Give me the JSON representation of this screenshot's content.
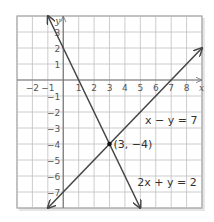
{
  "chart_data": {
    "type": "line",
    "title": "",
    "xlabel": "x",
    "ylabel": "y",
    "xlim": [
      -3,
      9
    ],
    "ylim": [
      -8,
      4
    ],
    "grid": true,
    "x_ticks": [
      "-2",
      "-1",
      "1",
      "2",
      "3",
      "4",
      "5",
      "6",
      "7",
      "8"
    ],
    "y_ticks": [
      "3",
      "2",
      "1",
      "-1",
      "-2",
      "-3",
      "-4",
      "-5",
      "-6",
      "-7"
    ],
    "series": [
      {
        "name": "x − y = 7",
        "equation": "x - y = 7",
        "points": [
          [
            -1,
            -8
          ],
          [
            9,
            2
          ]
        ],
        "color": "#444444"
      },
      {
        "name": "2x + y = 2",
        "equation": "2x + y = 2",
        "points": [
          [
            -1,
            4
          ],
          [
            5,
            -8
          ]
        ],
        "color": "#444444"
      }
    ],
    "annotations": [
      {
        "text": "(3, −4)",
        "x": 3,
        "y": -4,
        "marker": "point"
      },
      {
        "text": "x − y = 7",
        "near_series": 0
      },
      {
        "text": "2x + y = 2",
        "near_series": 1
      }
    ]
  },
  "labels": {
    "x_axis": "x",
    "y_axis": "y",
    "intersection": "(3, −4)",
    "line1": "x − y = 7",
    "line2": "2x + y = 2",
    "x_ticks": [
      "−2",
      "−1",
      "1",
      "2",
      "3",
      "4",
      "5",
      "6",
      "7",
      "8"
    ],
    "y_ticks": [
      "3",
      "2",
      "1",
      "−1",
      "−2",
      "−3",
      "−4",
      "−5",
      "−6",
      "−7"
    ]
  },
  "colors": {
    "grid": "#bfbfbf",
    "axis": "#777777",
    "line": "#444444",
    "frame": "#888888"
  }
}
